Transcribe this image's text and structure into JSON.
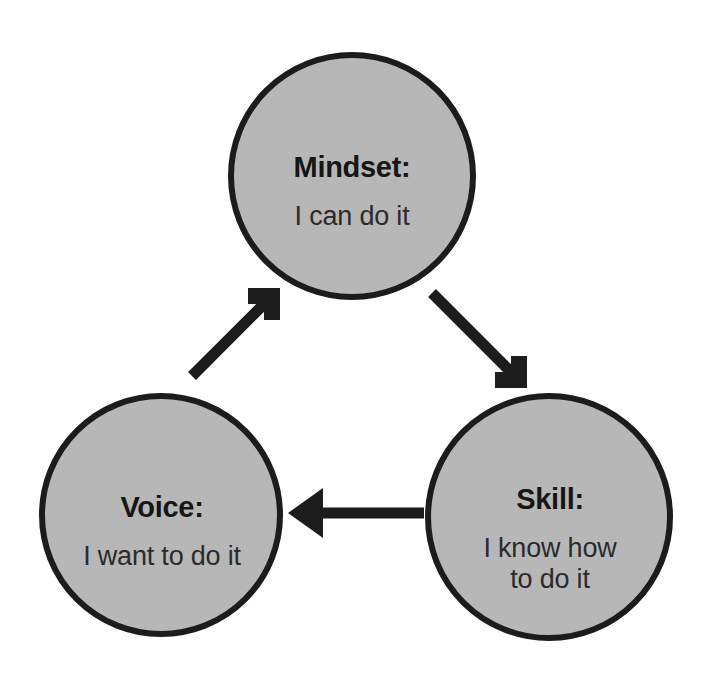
{
  "diagram": {
    "type": "cycle-diagram",
    "shape_fill": "#b7b7b7",
    "shape_stroke": "#1c1c1c",
    "arrow_color": "#1c1c1c",
    "background": "#ffffff",
    "nodes": [
      {
        "id": "mindset",
        "title": "Mindset:",
        "subtitle": "I can do it",
        "cx": 352,
        "cy": 176,
        "r": 124
      },
      {
        "id": "voice",
        "title": "Voice:",
        "subtitle": "I want to do it",
        "cx": 161,
        "cy": 515,
        "r": 122
      },
      {
        "id": "skill",
        "title": "Skill:",
        "subtitle": "I know how\nto do it",
        "cx": 549,
        "cy": 517,
        "r": 124
      }
    ],
    "arrows": [
      {
        "id": "mindset-to-skill",
        "from": "mindset",
        "to": "skill"
      },
      {
        "id": "skill-to-voice",
        "from": "skill",
        "to": "voice"
      },
      {
        "id": "voice-to-mindset",
        "from": "voice",
        "to": "mindset"
      }
    ]
  }
}
